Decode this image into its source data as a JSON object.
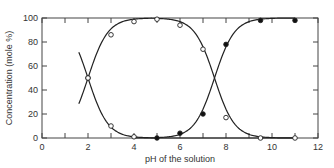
{
  "chart_data": {
    "type": "line",
    "title": "",
    "xlabel": "pH of the solution",
    "ylabel": "Concentration (mole %)",
    "xlim": [
      0,
      12
    ],
    "ylim": [
      0,
      100
    ],
    "x_ticks": [
      0,
      2,
      4,
      6,
      8,
      10,
      12
    ],
    "y_ticks": [
      0,
      20,
      40,
      60,
      80,
      100
    ],
    "x_minor_ticks": [
      1,
      3,
      5,
      7,
      9,
      11
    ],
    "grid": false,
    "legend": null,
    "series": [
      {
        "name": "open-circle species (rising)",
        "marker": "open-circle",
        "points": [
          [
            2,
            50
          ],
          [
            3,
            86
          ],
          [
            4,
            97
          ],
          [
            5,
            99
          ],
          [
            6,
            94
          ],
          [
            7,
            74
          ],
          [
            8,
            17
          ],
          [
            9.5,
            0
          ],
          [
            11,
            0
          ]
        ],
        "curve_start": [
          1.6,
          84
        ]
      },
      {
        "name": "open-circle species (falling)",
        "marker": "open-circle",
        "points": [
          [
            2,
            50
          ],
          [
            3,
            10
          ],
          [
            4,
            1
          ]
        ],
        "curve_start": [
          1.6,
          20
        ]
      },
      {
        "name": "filled-circle species",
        "marker": "filled-circle",
        "points": [
          [
            5,
            0
          ],
          [
            6,
            4
          ],
          [
            7,
            20
          ],
          [
            8,
            78
          ],
          [
            9.5,
            98
          ],
          [
            11,
            98
          ]
        ]
      }
    ],
    "crossings": [
      [
        2,
        50
      ],
      [
        7.5,
        47
      ]
    ]
  },
  "axes": {
    "x_tick_labels": [
      "0",
      "2",
      "4",
      "6",
      "8",
      "10",
      "12"
    ],
    "y_tick_labels": [
      "0",
      "20",
      "40",
      "60",
      "80",
      "100"
    ],
    "xlabel": "pH of the solution",
    "ylabel": "Concentration (mole %)"
  }
}
